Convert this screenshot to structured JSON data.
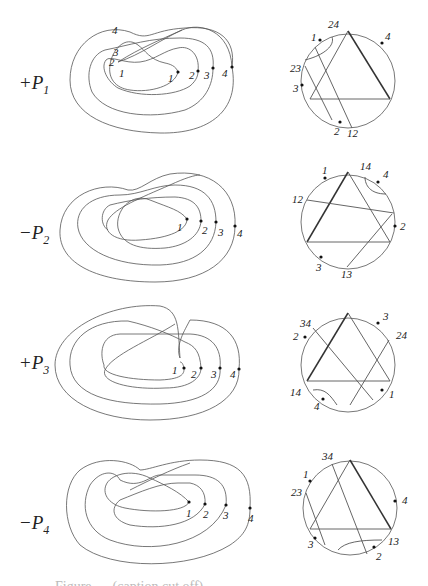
{
  "figure": {
    "rows": [
      {
        "id": "P1",
        "sign": "+",
        "name": "P",
        "index": "1",
        "curve_labels": [
          "4",
          "3",
          "2",
          "1",
          "1",
          "2",
          "3",
          "4"
        ],
        "chord_labels": [
          "24",
          "4",
          "1",
          "23",
          "3",
          "2",
          "12"
        ]
      },
      {
        "id": "P2",
        "sign": "−",
        "name": "P",
        "index": "2",
        "curve_labels": [
          "1",
          "2",
          "3",
          "4"
        ],
        "chord_labels": [
          "1",
          "14",
          "4",
          "12",
          "2",
          "3",
          "13"
        ]
      },
      {
        "id": "P3",
        "sign": "+",
        "name": "P",
        "index": "3",
        "curve_labels": [
          "1",
          "2",
          "3",
          "4"
        ],
        "chord_labels": [
          "34",
          "3",
          "2",
          "24",
          "14",
          "1",
          "4"
        ]
      },
      {
        "id": "P4",
        "sign": "−",
        "name": "P",
        "index": "4",
        "curve_labels": [
          "1",
          "2",
          "3",
          "4"
        ],
        "chord_labels": [
          "34",
          "1",
          "23",
          "4",
          "3",
          "13",
          "2"
        ]
      }
    ],
    "caption": "Figure … (caption cut off)"
  }
}
